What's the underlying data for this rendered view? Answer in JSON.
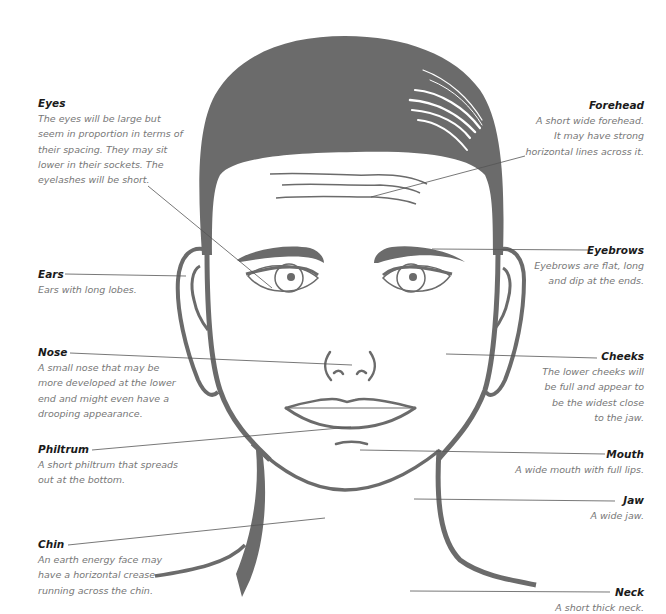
{
  "diagram": {
    "colors": {
      "fill": "#6b6b6b",
      "leader": "#555555",
      "title": "#1a1a1a",
      "text": "#777777",
      "background": "#ffffff"
    },
    "labels": {
      "eyes": {
        "title": "Eyes",
        "desc": "The eyes will be large but\nseem in proportion in terms of\ntheir spacing. They may sit\nlower in their sockets. The\neyelashes will be short."
      },
      "forehead": {
        "title": "Forehead",
        "desc": "A short wide forehead.\nIt may have strong\nhorizontal lines across it."
      },
      "ears": {
        "title": "Ears",
        "desc": "Ears with long lobes."
      },
      "eyebrows": {
        "title": "Eyebrows",
        "desc": "Eyebrows are flat, long\nand dip at the ends."
      },
      "nose": {
        "title": "Nose",
        "desc": "A small nose that may be\nmore developed at the lower\nend and might even have a\ndrooping appearance."
      },
      "cheeks": {
        "title": "Cheeks",
        "desc": "The lower cheeks will\nbe full and appear to\nbe the widest close\nto the jaw."
      },
      "philtrum": {
        "title": "Philtrum",
        "desc": "A short philtrum that spreads\nout at the bottom."
      },
      "mouth": {
        "title": "Mouth",
        "desc": "A wide mouth with full lips."
      },
      "jaw": {
        "title": "Jaw",
        "desc": "A wide jaw."
      },
      "chin": {
        "title": "Chin",
        "desc": "An earth energy face may\nhave a horizontal crease\nrunning across the chin."
      },
      "neck": {
        "title": "Neck",
        "desc": "A short thick neck."
      }
    }
  }
}
